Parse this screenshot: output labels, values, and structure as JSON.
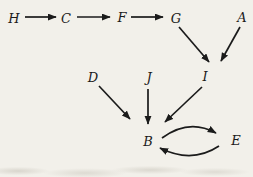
{
  "diagram": {
    "type": "directed-graph",
    "background_color": "#f2f0ea",
    "ink_color": "#1b1b1b",
    "nodes": [
      {
        "id": "H",
        "label": "H",
        "x": 14,
        "y": 18
      },
      {
        "id": "C",
        "label": "C",
        "x": 66,
        "y": 18
      },
      {
        "id": "F",
        "label": "F",
        "x": 122,
        "y": 17
      },
      {
        "id": "G",
        "label": "G",
        "x": 176,
        "y": 18
      },
      {
        "id": "A",
        "label": "A",
        "x": 242,
        "y": 17
      },
      {
        "id": "D",
        "label": "D",
        "x": 93,
        "y": 77
      },
      {
        "id": "J",
        "label": "J",
        "x": 149,
        "y": 77
      },
      {
        "id": "I",
        "label": "I",
        "x": 205,
        "y": 76
      },
      {
        "id": "B",
        "label": "B",
        "x": 148,
        "y": 141
      },
      {
        "id": "E",
        "label": "E",
        "x": 236,
        "y": 140
      }
    ],
    "edges": [
      {
        "from": "H",
        "to": "C",
        "path_type": "line",
        "x1": 25,
        "y1": 17,
        "x2": 56,
        "y2": 17
      },
      {
        "from": "C",
        "to": "F",
        "path_type": "line",
        "x1": 77,
        "y1": 17,
        "x2": 110,
        "y2": 17
      },
      {
        "from": "F",
        "to": "G",
        "path_type": "line",
        "x1": 131,
        "y1": 17,
        "x2": 163,
        "y2": 17
      },
      {
        "from": "G",
        "to": "I",
        "path_type": "line",
        "x1": 179,
        "y1": 27,
        "x2": 209,
        "y2": 62
      },
      {
        "from": "A",
        "to": "I",
        "path_type": "line",
        "x1": 240,
        "y1": 27,
        "x2": 221,
        "y2": 61
      },
      {
        "from": "D",
        "to": "B",
        "path_type": "line",
        "x1": 99,
        "y1": 86,
        "x2": 130,
        "y2": 119
      },
      {
        "from": "J",
        "to": "B",
        "path_type": "line",
        "x1": 148,
        "y1": 89,
        "x2": 148,
        "y2": 124
      },
      {
        "from": "I",
        "to": "B",
        "path_type": "line",
        "x1": 202,
        "y1": 87,
        "x2": 165,
        "y2": 122
      },
      {
        "from": "B",
        "to": "E",
        "path_type": "quad",
        "x1": 162,
        "y1": 138,
        "cx": 189,
        "cy": 118,
        "x2": 216,
        "y2": 133
      },
      {
        "from": "E",
        "to": "B",
        "path_type": "quad",
        "x1": 219,
        "y1": 146,
        "cx": 192,
        "cy": 164,
        "x2": 160,
        "y2": 148
      }
    ]
  }
}
